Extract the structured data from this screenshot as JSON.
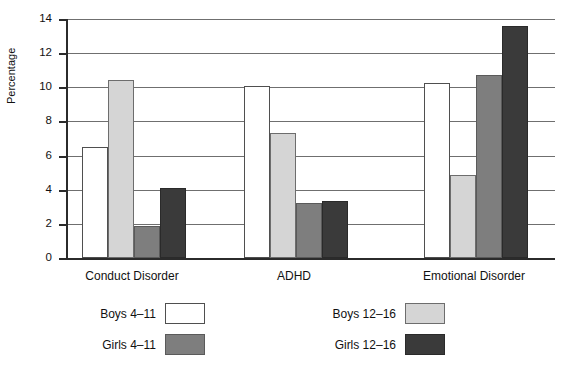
{
  "chart_data": {
    "type": "bar",
    "title": "",
    "subtitle": "",
    "xlabel": "",
    "ylabel": "Percentage",
    "ylim": [
      0,
      14
    ],
    "ytick_step": 2,
    "yticks": [
      "14",
      "12",
      "10",
      "8",
      "6",
      "4",
      "2",
      "0"
    ],
    "grid": true,
    "legend_position": "bottom",
    "categories": [
      "Conduct Disorder",
      "ADHD",
      "Emotional Disorder"
    ],
    "series": [
      {
        "name": "Boys 4–11",
        "swatch": "swatch-white",
        "color": "#ffffff",
        "values": [
          6.5,
          10.1,
          10.25
        ]
      },
      {
        "name": "Boys 12–16",
        "swatch": "swatch-light",
        "color": "#d5d5d5",
        "values": [
          10.4,
          7.35,
          4.85
        ]
      },
      {
        "name": "Girls 4–11",
        "swatch": "swatch-dark",
        "color": "#7e7e7e",
        "values": [
          1.9,
          3.25,
          10.7
        ]
      },
      {
        "name": "Girls 12–16",
        "swatch": "swatch-black",
        "color": "#3a3a3a",
        "values": [
          4.1,
          3.35,
          13.6
        ]
      }
    ]
  },
  "legend": {
    "items": [
      {
        "label": "Boys 4–11",
        "swatch": "swatch-white"
      },
      {
        "label": "Boys 12–16",
        "swatch": "swatch-light"
      },
      {
        "label": "Girls 4–11",
        "swatch": "swatch-dark"
      },
      {
        "label": "Girls 12–16",
        "swatch": "swatch-black"
      }
    ]
  }
}
